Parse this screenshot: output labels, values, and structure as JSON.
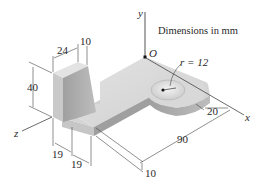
{
  "figure": {
    "note": "Dimensions in mm",
    "axes": {
      "x": "x",
      "y": "y",
      "z": "z",
      "origin": "O"
    },
    "radius_label": "r = 12",
    "dimensions": {
      "top_width": "24",
      "top_offset": "10",
      "height": "40",
      "base_19_a": "19",
      "base_19_b": "19",
      "length": "90",
      "hole_offset": "20",
      "thickness": "10"
    },
    "colors": {
      "face_light": "#d9d9d9",
      "face_mid": "#c4c4c4",
      "face_dark": "#a9a9a9",
      "line": "#3a3a3a"
    }
  }
}
